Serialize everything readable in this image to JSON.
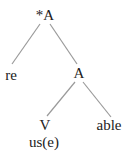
{
  "tree": {
    "nodes": [
      {
        "id": "root",
        "label": "*A",
        "x": 45,
        "y": 8
      },
      {
        "id": "re",
        "label": "re",
        "x": 11,
        "y": 68
      },
      {
        "id": "a2",
        "label": "A",
        "x": 79,
        "y": 66
      },
      {
        "id": "v",
        "label": "V",
        "x": 45,
        "y": 118
      },
      {
        "id": "use",
        "label": "us(e)",
        "x": 44,
        "y": 135
      },
      {
        "id": "able",
        "label": "able",
        "x": 109,
        "y": 118
      }
    ],
    "edges": [
      {
        "from": "root",
        "to": "re",
        "x1": 40,
        "y1": 24,
        "x2": 12,
        "y2": 64
      },
      {
        "from": "root",
        "to": "a2",
        "x1": 50,
        "y1": 24,
        "x2": 77,
        "y2": 64
      },
      {
        "from": "a2",
        "to": "v",
        "x1": 75,
        "y1": 82,
        "x2": 47,
        "y2": 116
      },
      {
        "from": "a2",
        "to": "able",
        "x1": 83,
        "y1": 82,
        "x2": 111,
        "y2": 117
      }
    ],
    "colors": {
      "line": "#9a9a9a",
      "text": "#222222"
    }
  }
}
